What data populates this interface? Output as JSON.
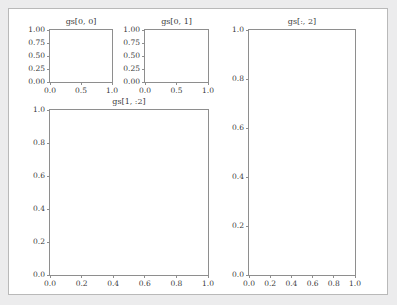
{
  "figure": {
    "background": "#ffffff",
    "page_background": "#ececed",
    "border_color": "#b9b9b9"
  },
  "chart_data": {
    "type": "table",
    "title": "",
    "grid": false,
    "axes": [
      {
        "name": "gs[0, 0]",
        "title": "gs[0, 0]",
        "xlim": [
          0.0,
          1.0
        ],
        "ylim": [
          0.0,
          1.0
        ],
        "xticks": [
          "0.0",
          "0.5",
          "1.0"
        ],
        "xtick_values": [
          0.0,
          0.5,
          1.0
        ],
        "yticks": [
          "0.00",
          "0.25",
          "0.50",
          "0.75",
          "1.00"
        ],
        "ytick_values": [
          0.0,
          0.25,
          0.5,
          0.75,
          1.0
        ],
        "xlabel": "",
        "ylabel": "",
        "series": []
      },
      {
        "name": "gs[0, 1]",
        "title": "gs[0, 1]",
        "xlim": [
          0.0,
          1.0
        ],
        "ylim": [
          0.0,
          1.0
        ],
        "xticks": [
          "0.0",
          "0.5",
          "1.0"
        ],
        "xtick_values": [
          0.0,
          0.5,
          1.0
        ],
        "yticks": [
          "0.00",
          "0.25",
          "0.50",
          "0.75",
          "1.00"
        ],
        "ytick_values": [
          0.0,
          0.25,
          0.5,
          0.75,
          1.0
        ],
        "xlabel": "",
        "ylabel": "",
        "series": []
      },
      {
        "name": "gs[1, :2]",
        "title": "gs[1, :2]",
        "xlim": [
          0.0,
          1.0
        ],
        "ylim": [
          0.0,
          1.0
        ],
        "xticks": [
          "0.0",
          "0.2",
          "0.4",
          "0.6",
          "0.8",
          "1.0"
        ],
        "xtick_values": [
          0.0,
          0.2,
          0.4,
          0.6,
          0.8,
          1.0
        ],
        "yticks": [
          "0.0",
          "0.2",
          "0.4",
          "0.6",
          "0.8",
          "1.0"
        ],
        "ytick_values": [
          0.0,
          0.2,
          0.4,
          0.6,
          0.8,
          1.0
        ],
        "xlabel": "",
        "ylabel": "",
        "series": []
      },
      {
        "name": "gs[:, 2]",
        "title": "gs[:, 2]",
        "xlim": [
          0.0,
          1.0
        ],
        "ylim": [
          0.0,
          1.0
        ],
        "xticks": [
          "0.0",
          "0.2",
          "0.4",
          "0.6",
          "0.8",
          "1.0"
        ],
        "xtick_values": [
          0.0,
          0.2,
          0.4,
          0.6,
          0.8,
          1.0
        ],
        "yticks": [
          "0.0",
          "0.2",
          "0.4",
          "0.6",
          "0.8",
          "1.0"
        ],
        "ytick_values": [
          0.0,
          0.2,
          0.4,
          0.6,
          0.8,
          1.0
        ],
        "xlabel": "",
        "ylabel": "",
        "series": []
      }
    ]
  }
}
